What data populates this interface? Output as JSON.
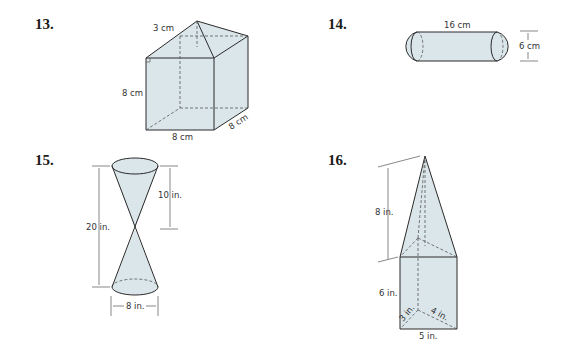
{
  "problems": [
    {
      "number": "13.",
      "figure": "square prism with pyramid top",
      "labels": {
        "pyramid_height": "3 cm",
        "prism_height": "8 cm",
        "base_width": "8 cm",
        "base_depth": "8 cm"
      }
    },
    {
      "number": "14.",
      "figure": "cylinder with hemispherical ends",
      "labels": {
        "length": "16 cm",
        "diameter": "6 cm"
      }
    },
    {
      "number": "15.",
      "figure": "double cone (hourglass)",
      "labels": {
        "total_height": "20 in.",
        "cone_height": "10 in.",
        "diameter": "8 in."
      }
    },
    {
      "number": "16.",
      "figure": "triangular prism with pyramid top",
      "labels": {
        "pyramid_height": "8 in.",
        "prism_height": "6 in.",
        "base_leg_a": "3 in.",
        "base_leg_b": "4 in.",
        "base_hyp": "5 in."
      }
    }
  ],
  "colors": {
    "fill": "#dbe6ea",
    "edge": "#2a2a2a",
    "text": "#333333"
  }
}
